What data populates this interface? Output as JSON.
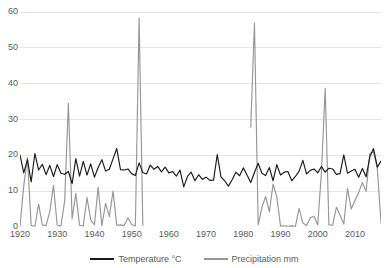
{
  "chart_data": {
    "type": "line",
    "title": "",
    "xlabel": "",
    "ylabel": "",
    "xlim": [
      1920,
      2017
    ],
    "ylim": [
      0,
      60
    ],
    "grid": true,
    "legend_position": "bottom",
    "xticks": [
      1920,
      1930,
      1940,
      1950,
      1960,
      1970,
      1980,
      1990,
      2000,
      2010
    ],
    "yticks": [
      0,
      10,
      20,
      30,
      40,
      50,
      60
    ],
    "x": [
      1920,
      1921,
      1922,
      1923,
      1924,
      1925,
      1926,
      1927,
      1928,
      1929,
      1930,
      1931,
      1932,
      1933,
      1934,
      1935,
      1936,
      1937,
      1938,
      1939,
      1940,
      1941,
      1942,
      1943,
      1944,
      1945,
      1946,
      1947,
      1948,
      1949,
      1950,
      1951,
      1952,
      1953,
      1954,
      1955,
      1956,
      1957,
      1958,
      1959,
      1960,
      1961,
      1962,
      1963,
      1964,
      1965,
      1966,
      1967,
      1968,
      1969,
      1970,
      1971,
      1972,
      1973,
      1974,
      1975,
      1976,
      1977,
      1978,
      1979,
      1980,
      1981,
      1982,
      1983,
      1984,
      1985,
      1986,
      1987,
      1988,
      1989,
      1990,
      1991,
      1992,
      1993,
      1994,
      1995,
      1996,
      1997,
      1998,
      1999,
      2000,
      2001,
      2002,
      2003,
      2004,
      2005,
      2006,
      2007,
      2008,
      2009,
      2010,
      2011,
      2012,
      2013,
      2014,
      2015,
      2016,
      2017
    ],
    "series": [
      {
        "name": "Temperature °C",
        "color": "#1a1a1a",
        "unit": "°C",
        "values": [
          20.1,
          15.1,
          18.8,
          12.6,
          20.5,
          15.9,
          17.5,
          14.6,
          17.2,
          14.1,
          17.4,
          15.0,
          14.7,
          15.5,
          12.1,
          19.1,
          14.2,
          18.3,
          14.5,
          17.6,
          13.9,
          16.6,
          18.8,
          15.6,
          16.1,
          19.0,
          21.9,
          16.0,
          15.9,
          16.2,
          14.9,
          14.4,
          17.9,
          15.2,
          14.8,
          17.3,
          16.1,
          16.9,
          15.4,
          16.7,
          15.1,
          15.5,
          14.2,
          15.9,
          11.2,
          14.1,
          15.3,
          12.9,
          14.6,
          13.3,
          13.9,
          13.0,
          13.1,
          20.2,
          14.0,
          12.9,
          11.4,
          13.2,
          15.3,
          14.3,
          16.5,
          14.5,
          12.4,
          15.2,
          17.8,
          15.0,
          14.4,
          16.6,
          12.9,
          17.4,
          14.5,
          15.3,
          15.5,
          12.9,
          14.1,
          15.6,
          18.6,
          14.8,
          15.8,
          16.2,
          15.1,
          16.9,
          15.3,
          16.4,
          16.2,
          14.7,
          14.9,
          20.1,
          15.0,
          15.6,
          16.1,
          13.9,
          16.3,
          14.0,
          19.6,
          21.9,
          16.7,
          18.4
        ]
      },
      {
        "name": "Precipitation mm",
        "color": "#969696",
        "unit": "mm",
        "values": [
          0.2,
          11.4,
          19.4,
          0.4,
          0.2,
          6.4,
          0.6,
          0.4,
          4.3,
          11.6,
          0.5,
          0.3,
          7.3,
          34.5,
          2.3,
          9.4,
          0.5,
          0.3,
          8.2,
          2.0,
          0.6,
          11.1,
          0.4,
          6.6,
          2.9,
          10.0,
          0.5,
          0.6,
          0.4,
          2.6,
          0.7,
          0.3,
          58.3,
          0.5,
          null,
          null,
          null,
          null,
          null,
          null,
          null,
          null,
          null,
          null,
          null,
          null,
          null,
          null,
          null,
          null,
          null,
          null,
          null,
          null,
          null,
          null,
          null,
          null,
          null,
          null,
          null,
          null,
          27.9,
          57.0,
          0.6,
          5.5,
          8.5,
          4.2,
          12.0,
          8.5,
          0.3,
          0.3,
          0.2,
          0.3,
          0.2,
          5.2,
          1.1,
          0.4,
          2.6,
          3.0,
          0.6,
          15.2,
          38.7,
          0.6,
          0.5,
          5.5,
          3.3,
          0.8,
          10.8,
          5.0,
          7.4,
          9.6,
          12.4,
          10.0,
          20.5,
          21.0,
          16.5,
          1.2
        ]
      }
    ]
  },
  "legend": {
    "entries": [
      {
        "label": "Temperature °C",
        "color": "#1a1a1a"
      },
      {
        "label": "Precipitation mm",
        "color": "#969696"
      }
    ]
  }
}
